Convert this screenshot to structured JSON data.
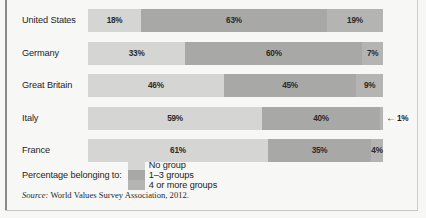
{
  "chart_data": {
    "type": "bar",
    "orientation": "horizontal",
    "stacked": true,
    "normalized_percent": true,
    "title": "",
    "subtitle": "",
    "xlabel": "",
    "ylabel": "",
    "xlim": [
      0,
      100
    ],
    "grid": false,
    "legend_position": "bottom",
    "legend_title": "Percentage belonging to:",
    "categories": [
      "United States",
      "Germany",
      "Great Britain",
      "Italy",
      "France"
    ],
    "series": [
      {
        "name": "No group",
        "color": "#d5d5d3",
        "values": [
          18,
          33,
          46,
          59,
          61
        ]
      },
      {
        "name": "1–3 groups",
        "color": "#a8a8a6",
        "values": [
          63,
          60,
          45,
          40,
          35
        ]
      },
      {
        "name": "4 or more groups",
        "color": "#b4b4b2",
        "values": [
          19,
          7,
          9,
          1,
          4
        ]
      }
    ],
    "data_labels": [
      [
        "18%",
        "63%",
        "19%"
      ],
      [
        "33%",
        "60%",
        "7%"
      ],
      [
        "46%",
        "45%",
        "9%"
      ],
      [
        "59%",
        "40%",
        "1%"
      ],
      [
        "61%",
        "35%",
        "4%"
      ]
    ],
    "annotations": [
      {
        "row": "Italy",
        "series": "4 or more groups",
        "text": "1%",
        "arrow": "←",
        "placement": "outside-right",
        "reason": "segment too small for inline label"
      }
    ],
    "source": {
      "lead": "Source:",
      "text": " World Values Survey Association, 2012."
    }
  },
  "rows": [
    {
      "label": "United States",
      "segments": [
        {
          "value": 18,
          "label": "18%",
          "class": "c0",
          "show_label": true
        },
        {
          "value": 63,
          "label": "63%",
          "class": "c1",
          "show_label": true
        },
        {
          "value": 19,
          "label": "19%",
          "class": "c2",
          "show_label": true
        }
      ]
    },
    {
      "label": "Germany",
      "segments": [
        {
          "value": 33,
          "label": "33%",
          "class": "c0",
          "show_label": true
        },
        {
          "value": 60,
          "label": "60%",
          "class": "c1",
          "show_label": true
        },
        {
          "value": 7,
          "label": "7%",
          "class": "c2",
          "show_label": true
        }
      ]
    },
    {
      "label": "Great Britain",
      "segments": [
        {
          "value": 46,
          "label": "46%",
          "class": "c0",
          "show_label": true
        },
        {
          "value": 45,
          "label": "45%",
          "class": "c1",
          "show_label": true
        },
        {
          "value": 9,
          "label": "9%",
          "class": "c2",
          "show_label": true
        }
      ]
    },
    {
      "label": "Italy",
      "callout": {
        "arrow": "←",
        "text": "1%"
      },
      "segments": [
        {
          "value": 59,
          "label": "59%",
          "class": "c0",
          "show_label": true
        },
        {
          "value": 40,
          "label": "40%",
          "class": "c1",
          "show_label": true
        },
        {
          "value": 1,
          "label": "1%",
          "class": "c2",
          "show_label": false
        }
      ]
    },
    {
      "label": "France",
      "segments": [
        {
          "value": 61,
          "label": "61%",
          "class": "c0",
          "show_label": true
        },
        {
          "value": 35,
          "label": "35%",
          "class": "c1",
          "show_label": true
        },
        {
          "value": 4,
          "label": "4%",
          "class": "c2",
          "show_label": true
        }
      ]
    }
  ],
  "legend": {
    "title": "Percentage belonging to:",
    "items": [
      {
        "label": "No group",
        "class": "c0"
      },
      {
        "label": "1–3 groups",
        "class": "c1"
      },
      {
        "label": "4 or more groups",
        "class": "c2"
      }
    ]
  },
  "source": {
    "lead": "Source:",
    "text": " World Values Survey Association, 2012."
  }
}
